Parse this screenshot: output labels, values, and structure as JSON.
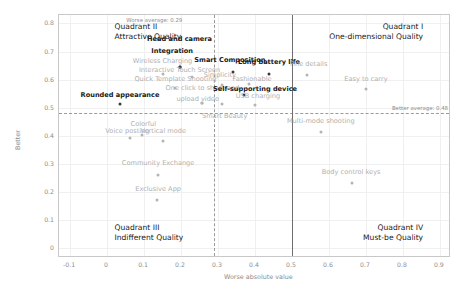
{
  "chart_data": {
    "type": "scatter",
    "title": "",
    "xlabel": "Worse absolute value",
    "ylabel": "Better",
    "xlim": [
      -0.13,
      0.93
    ],
    "ylim": [
      -0.035,
      0.83
    ],
    "xticks": [
      "-0.1",
      "0",
      "0.1",
      "0.2",
      "0.3",
      "0.4",
      "0.5",
      "0.6",
      "0.7",
      "0.8",
      "0.9"
    ],
    "xtick_values": [
      -0.1,
      0,
      0.1,
      0.2,
      0.3,
      0.4,
      0.5,
      0.6,
      0.7,
      0.8,
      0.9
    ],
    "yticks": [
      "0",
      "0.1",
      "0.2",
      "0.3",
      "0.4",
      "0.5",
      "0.6",
      "0.7",
      "0.8"
    ],
    "ytick_values": [
      0,
      0.1,
      0.2,
      0.3,
      0.4,
      0.5,
      0.6,
      0.7,
      0.8
    ],
    "grid": true,
    "legend": "none",
    "reference_lines": [
      {
        "name": "worse-average",
        "orientation": "vertical",
        "value": 0.29,
        "label": "Worse average: 0.29",
        "style": "dashed"
      },
      {
        "name": "better-average",
        "orientation": "horizontal",
        "value": 0.48,
        "label": "Better average: 0.48",
        "style": "dashed"
      },
      {
        "name": "mid-vertical",
        "orientation": "vertical",
        "value": 0.5,
        "label": "",
        "style": "solid"
      }
    ],
    "quadrants": [
      {
        "id": "II",
        "name": "quadrant-2",
        "line1": "Quadrant II",
        "line2": "Attractive Quality",
        "x": 0.02,
        "y": 0.79
      },
      {
        "id": "I",
        "name": "quadrant-1",
        "line1": "Quadrant I",
        "line2": "One-dimensional Quality",
        "x": 0.86,
        "y": 0.79
      },
      {
        "id": "III",
        "name": "quadrant-3",
        "line1": "Quadrant III",
        "line2": "Indifferent Quality",
        "x": 0.02,
        "y": 0.075
      },
      {
        "id": "IV",
        "name": "quadrant-4",
        "line1": "Quadrant IV",
        "line2": "Must-be Quality",
        "x": 0.86,
        "y": 0.075
      }
    ],
    "points": [
      {
        "label": "Head and camera",
        "x": 0.196,
        "y": 0.645,
        "emphasis": "dark",
        "lx": 0.196,
        "ly": 0.742,
        "anchor": "center"
      },
      {
        "label": "Integration",
        "x": 0.196,
        "y": 0.645,
        "emphasis": "dark",
        "lx": 0.176,
        "ly": 0.7,
        "anchor": "center"
      },
      {
        "label": "Wireless Charging",
        "x": 0.15,
        "y": 0.62,
        "emphasis": "gray",
        "lx": 0.15,
        "ly": 0.663,
        "anchor": "center"
      },
      {
        "label": "Interactive Touch Screen",
        "x": 0.229,
        "y": 0.608,
        "emphasis": "gray",
        "lx": 0.196,
        "ly": 0.632,
        "anchor": "center"
      },
      {
        "label": "Smart Composition",
        "x": 0.34,
        "y": 0.628,
        "emphasis": "dark",
        "lx": 0.332,
        "ly": 0.665,
        "anchor": "center"
      },
      {
        "label": "Long battery life",
        "x": 0.438,
        "y": 0.62,
        "emphasis": "dark",
        "lx": 0.438,
        "ly": 0.658,
        "anchor": "center"
      },
      {
        "label": "Fine details",
        "x": 0.54,
        "y": 0.616,
        "emphasis": "gray",
        "lx": 0.545,
        "ly": 0.652,
        "anchor": "center"
      },
      {
        "label": "Simplicity",
        "x": 0.31,
        "y": 0.58,
        "emphasis": "gray",
        "lx": 0.305,
        "ly": 0.612,
        "anchor": "center"
      },
      {
        "label": "Fashionable",
        "x": 0.385,
        "y": 0.585,
        "emphasis": "gray",
        "lx": 0.392,
        "ly": 0.6,
        "anchor": "center"
      },
      {
        "label": "Easy to carry",
        "x": 0.7,
        "y": 0.565,
        "emphasis": "gray",
        "lx": 0.7,
        "ly": 0.598,
        "anchor": "center"
      },
      {
        "label": "Quick Template Shooting",
        "x": 0.185,
        "y": 0.57,
        "emphasis": "gray",
        "lx": 0.185,
        "ly": 0.598,
        "anchor": "center"
      },
      {
        "label": "One click to shoot and",
        "x": 0.258,
        "y": 0.516,
        "emphasis": "gray",
        "lx": 0.258,
        "ly": 0.565,
        "anchor": "center"
      },
      {
        "label": "upload video",
        "x": 0.258,
        "y": 0.516,
        "emphasis": "gray",
        "lx": 0.245,
        "ly": 0.527,
        "anchor": "center"
      },
      {
        "label": "Self-supporting device",
        "x": 0.37,
        "y": 0.545,
        "emphasis": "dark",
        "lx": 0.4,
        "ly": 0.562,
        "anchor": "center"
      },
      {
        "label": "USB charging",
        "x": 0.4,
        "y": 0.51,
        "emphasis": "gray",
        "lx": 0.408,
        "ly": 0.537,
        "anchor": "center"
      },
      {
        "label": "Rounded appearance",
        "x": 0.035,
        "y": 0.512,
        "emphasis": "dark",
        "lx": 0.035,
        "ly": 0.54,
        "anchor": "center"
      },
      {
        "label": "Smart Beauty",
        "x": 0.31,
        "y": 0.513,
        "emphasis": "gray",
        "lx": 0.318,
        "ly": 0.466,
        "anchor": "center"
      },
      {
        "label": "Colorful",
        "x": 0.095,
        "y": 0.403,
        "emphasis": "gray",
        "lx": 0.098,
        "ly": 0.44,
        "anchor": "center"
      },
      {
        "label": "Voice posting",
        "x": 0.062,
        "y": 0.392,
        "emphasis": "gray",
        "lx": 0.055,
        "ly": 0.412,
        "anchor": "center"
      },
      {
        "label": "Vertical mode",
        "x": 0.15,
        "y": 0.383,
        "emphasis": "gray",
        "lx": 0.152,
        "ly": 0.415,
        "anchor": "center"
      },
      {
        "label": "Multi-mode shooting",
        "x": 0.578,
        "y": 0.412,
        "emphasis": "gray",
        "lx": 0.578,
        "ly": 0.448,
        "anchor": "center"
      },
      {
        "label": "Community Exchange",
        "x": 0.138,
        "y": 0.262,
        "emphasis": "gray",
        "lx": 0.138,
        "ly": 0.298,
        "anchor": "center"
      },
      {
        "label": "Body control keys",
        "x": 0.662,
        "y": 0.233,
        "emphasis": "gray",
        "lx": 0.66,
        "ly": 0.268,
        "anchor": "center"
      },
      {
        "label": "Exclusive App",
        "x": 0.136,
        "y": 0.172,
        "emphasis": "gray",
        "lx": 0.138,
        "ly": 0.207,
        "anchor": "center"
      }
    ]
  }
}
